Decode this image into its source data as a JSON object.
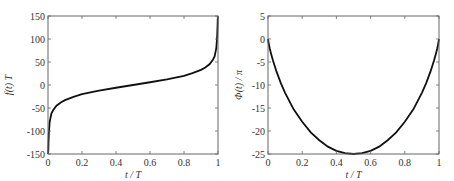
{
  "chart_data": [
    {
      "type": "line",
      "title": "",
      "xlabel": "t / T",
      "ylabel": "f(t) T",
      "xlim": [
        0,
        1
      ],
      "ylim": [
        -150,
        150
      ],
      "xticks": [
        0,
        0.2,
        0.4,
        0.6,
        0.8,
        1
      ],
      "xtick_labels": [
        "0",
        "0.2",
        "0.4",
        "0.6",
        "0.8",
        "1"
      ],
      "yticks": [
        150,
        100,
        50,
        0,
        -50,
        -100,
        -150
      ],
      "ytick_labels": [
        "150",
        "100",
        "50",
        "0",
        "-50",
        "-100",
        "-150"
      ],
      "grid": false,
      "legend": null,
      "series": [
        {
          "name": "f(t) T",
          "x": [
            0.001,
            0.003,
            0.005,
            0.01,
            0.02,
            0.03,
            0.05,
            0.075,
            0.1,
            0.15,
            0.2,
            0.3,
            0.4,
            0.5,
            0.6,
            0.7,
            0.8,
            0.85,
            0.9,
            0.925,
            0.95,
            0.97,
            0.98,
            0.99,
            0.995,
            0.997,
            0.999
          ],
          "y": [
            -150,
            -125,
            -105,
            -80,
            -62,
            -55,
            -45,
            -38,
            -33,
            -26,
            -20,
            -12,
            -6,
            0,
            6,
            12,
            20,
            26,
            33,
            38,
            45,
            55,
            62,
            80,
            105,
            125,
            150
          ]
        }
      ]
    },
    {
      "type": "line",
      "title": "",
      "xlabel": "t / T",
      "ylabel": "Φ(t) / π",
      "xlim": [
        0,
        1
      ],
      "ylim": [
        -25,
        5
      ],
      "xticks": [
        0,
        0.2,
        0.4,
        0.6,
        0.8,
        1
      ],
      "xtick_labels": [
        "0",
        "0.2",
        "0.4",
        "0.6",
        "0.8",
        "1"
      ],
      "yticks": [
        5,
        0,
        -5,
        -10,
        -15,
        -20,
        -25
      ],
      "ytick_labels": [
        "5",
        "0",
        "-5",
        "-10",
        "-15",
        "-20",
        "-25"
      ],
      "grid": false,
      "legend": null,
      "series": [
        {
          "name": "Φ(t) / π",
          "x": [
            0,
            0.005,
            0.01,
            0.02,
            0.03,
            0.05,
            0.075,
            0.1,
            0.15,
            0.2,
            0.25,
            0.3,
            0.35,
            0.4,
            0.45,
            0.5,
            0.55,
            0.6,
            0.65,
            0.7,
            0.75,
            0.8,
            0.85,
            0.9,
            0.925,
            0.95,
            0.97,
            0.98,
            0.99,
            0.995,
            1
          ],
          "y": [
            0,
            -1.1,
            -2.0,
            -3.5,
            -4.8,
            -7.1,
            -9.6,
            -11.7,
            -15.3,
            -18.0,
            -20.3,
            -22.0,
            -23.4,
            -24.3,
            -24.8,
            -25.0,
            -24.8,
            -24.3,
            -23.4,
            -22.0,
            -20.3,
            -18.0,
            -15.3,
            -11.7,
            -9.6,
            -7.1,
            -4.8,
            -3.5,
            -2.0,
            -1.1,
            0
          ]
        }
      ]
    }
  ],
  "left_plot": {
    "xlabel": "t / T",
    "ylabel": "f(t) T"
  },
  "right_plot": {
    "xlabel": "t / T",
    "ylabel": "Φ(t) / π"
  }
}
